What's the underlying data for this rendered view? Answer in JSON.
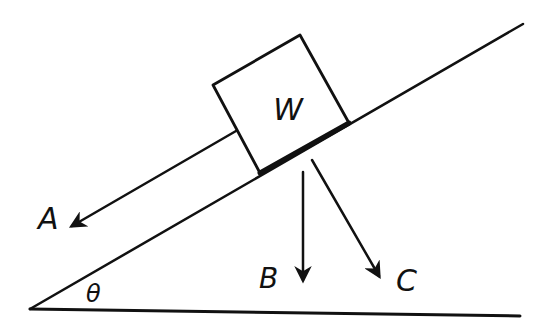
{
  "diagram": {
    "type": "free-body diagram",
    "stroke_color": "#111111",
    "background_color": "#ffffff",
    "block": {
      "label": "W"
    },
    "angle": {
      "label": "θ"
    },
    "arrows": [
      {
        "id": "A",
        "label": "A",
        "direction": "down-slope, parallel to incline"
      },
      {
        "id": "B",
        "label": "B",
        "direction": "vertically downward"
      },
      {
        "id": "C",
        "label": "C",
        "direction": "perpendicular to incline, into the plane"
      }
    ]
  }
}
